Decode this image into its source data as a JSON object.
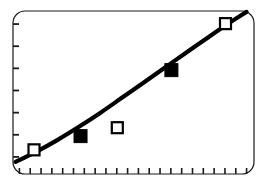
{
  "figure": {
    "width": 265,
    "height": 187,
    "background_color": "#ffffff",
    "frame": {
      "color": "#1a1a1a",
      "line_width": 1.2,
      "corner_radius": 12,
      "x": 13,
      "y": 11,
      "width": 241,
      "height": 163
    }
  },
  "chart_data": {
    "type": "line",
    "title": "",
    "subtitle": "",
    "xlabel": "",
    "ylabel": "",
    "grid": false,
    "legend": "none",
    "axis_tick_labels_shown": false,
    "xlim": [
      0,
      22
    ],
    "ylim": [
      0,
      7
    ],
    "x_major_ticks": 22,
    "y_major_ticks": 7,
    "x_tick_direction": "inward",
    "y_tick_direction": "inward",
    "x_tick_length": 6,
    "y_tick_length": 6,
    "tick_color": "#1a1a1a",
    "series": [
      {
        "name": "fitted-curve",
        "type": "line",
        "color": "#000000",
        "line_width": 4.2,
        "marker": "none",
        "points": [
          {
            "x": 0.15,
            "y": 0.28
          },
          {
            "x": 2.0,
            "y": 0.72
          },
          {
            "x": 4.0,
            "y": 1.26
          },
          {
            "x": 6.0,
            "y": 1.86
          },
          {
            "x": 8.0,
            "y": 2.5
          },
          {
            "x": 10.0,
            "y": 3.18
          },
          {
            "x": 12.0,
            "y": 3.86
          },
          {
            "x": 14.0,
            "y": 4.55
          },
          {
            "x": 16.0,
            "y": 5.24
          },
          {
            "x": 18.0,
            "y": 5.92
          },
          {
            "x": 20.0,
            "y": 6.58
          },
          {
            "x": 21.5,
            "y": 7.05
          }
        ]
      },
      {
        "name": "open-square-observations",
        "type": "scatter",
        "marker": "open-square",
        "marker_size": 11,
        "edge_color": "#000000",
        "fill_color": "#ffffff",
        "edge_width": 2.2,
        "points": [
          {
            "x": 1.85,
            "y": 0.82
          },
          {
            "x": 9.55,
            "y": 1.82
          },
          {
            "x": 19.55,
            "y": 6.52
          }
        ]
      },
      {
        "name": "filled-square-observations",
        "type": "scatter",
        "marker": "filled-square",
        "marker_size": 13,
        "edge_color": "#000000",
        "fill_color": "#000000",
        "edge_width": 1,
        "points": [
          {
            "x": 6.15,
            "y": 1.44
          },
          {
            "x": 14.55,
            "y": 4.42
          }
        ]
      }
    ]
  }
}
